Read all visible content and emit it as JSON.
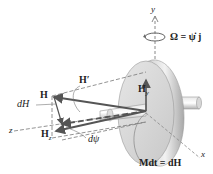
{
  "diagram": {
    "type": "3D rigid body dynamics figure: rotating disk with precessing angular momentum",
    "axes": {
      "y": "y",
      "z": "z",
      "x": "x"
    },
    "labels": {
      "omega": "Ω = ψ̇ j",
      "H_prime": "H′",
      "H": "H",
      "dH": "dH",
      "Hz": "H",
      "Hz_sub": "z",
      "Hy": "H",
      "Hy_sub": "y",
      "dpsi": "dψ",
      "moment": "Mdt = dH"
    },
    "colors": {
      "disk_face": "#d8d8d8",
      "disk_rim": "#b5b5b5",
      "vector": "#555555",
      "dashed_axis": "#777777",
      "text": "#222222"
    }
  }
}
